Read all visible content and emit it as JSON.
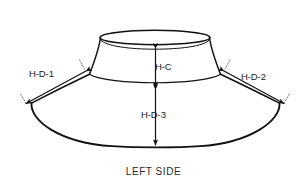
{
  "diagram": {
    "title": "LEFT SIDE",
    "background_color": "#ffffff",
    "line_color": "#111111",
    "label_color": "#1b1b1b",
    "dimensions": [
      {
        "id": "hd1",
        "label": "H-D-1",
        "kind": "brim-width-left",
        "arrow": "double",
        "side": "left"
      },
      {
        "id": "hd2",
        "label": "H-D-2",
        "kind": "brim-width-right",
        "arrow": "double",
        "side": "right"
      },
      {
        "id": "hc",
        "label": "H-C",
        "kind": "crown-height",
        "arrow": "double",
        "side": "center"
      },
      {
        "id": "hd3",
        "label": "H-D-3",
        "kind": "brim-drop-height",
        "arrow": "double",
        "side": "center"
      }
    ]
  }
}
